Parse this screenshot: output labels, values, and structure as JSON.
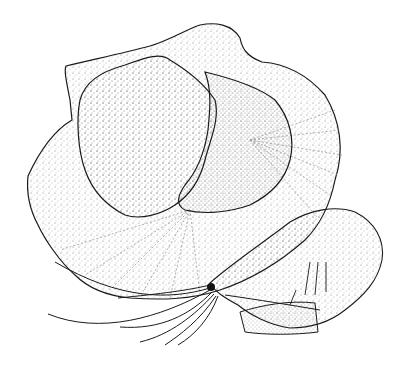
{
  "illustration": {
    "subject": "scallop and shrimp stipple drawing",
    "colors": {
      "background": "#ffffff",
      "ink": "#1a1a1a",
      "stipple": "#555555"
    }
  }
}
